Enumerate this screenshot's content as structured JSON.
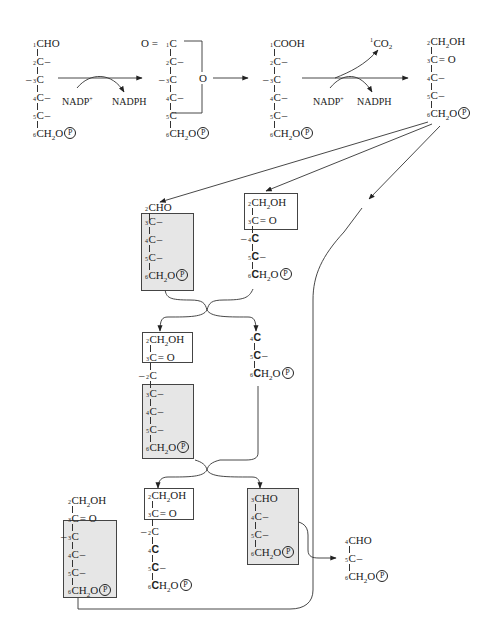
{
  "diagram": {
    "colors": {
      "line": "#333333",
      "box_border": "#444444",
      "highlight_box_fill": "#e6e6e6",
      "background": "#ffffff"
    },
    "phosphate_symbol": "P",
    "top_row": {
      "molecules": [
        {
          "id": "glucose-6-phosphate",
          "rows": [
            {
              "num": "1",
              "text": "CHO"
            },
            {
              "num": "2",
              "text": "C",
              "suffix": "–"
            },
            {
              "num": "3",
              "text": "C",
              "prefix": "–"
            },
            {
              "num": "4",
              "text": "C",
              "suffix": "–"
            },
            {
              "num": "5",
              "text": "C",
              "suffix": "–"
            },
            {
              "num": "6",
              "text": "CH",
              "sub": "2",
              "tail": "O",
              "phosphate": true
            }
          ]
        },
        {
          "id": "6-phosphoglucono-lactone",
          "rows": [
            {
              "num": "1",
              "text": "C",
              "prefix": "O = "
            },
            {
              "num": "2",
              "text": "C",
              "suffix": "–"
            },
            {
              "num": "3",
              "text": "C",
              "prefix": "–"
            },
            {
              "num": "4",
              "text": "C",
              "suffix": "–"
            },
            {
              "num": "5",
              "text": "C"
            },
            {
              "num": "6",
              "text": "CH",
              "sub": "2",
              "tail": "O",
              "phosphate": true
            }
          ],
          "ring_oxygen": "O"
        },
        {
          "id": "6-phosphogluconate",
          "rows": [
            {
              "num": "1",
              "text": "COOH"
            },
            {
              "num": "2",
              "text": "C",
              "suffix": "–"
            },
            {
              "num": "3",
              "text": "C",
              "prefix": "–"
            },
            {
              "num": "4",
              "text": "C",
              "suffix": "–"
            },
            {
              "num": "5",
              "text": "C",
              "suffix": "–"
            },
            {
              "num": "6",
              "text": "CH",
              "sub": "2",
              "tail": "O",
              "phosphate": true
            }
          ]
        },
        {
          "id": "ribulose-5-phosphate",
          "rows": [
            {
              "num": "2",
              "text": "CH",
              "sub": "2",
              "tail": "OH"
            },
            {
              "num": "3",
              "text": "C",
              "suffix": "= O"
            },
            {
              "num": "4",
              "text": "C",
              "suffix": "–"
            },
            {
              "num": "5",
              "text": "C",
              "suffix": "–"
            },
            {
              "num": "6",
              "text": "CH",
              "sub": "2",
              "tail": "O",
              "phosphate": true
            }
          ]
        }
      ],
      "reaction_1": {
        "cofactor_in": "NADP",
        "cofactor_in_sup": "+",
        "cofactor_out": "NADPH"
      },
      "reaction_3": {
        "cofactor_in": "NADP",
        "cofactor_in_sup": "+",
        "cofactor_out": "NADPH",
        "released": "CO",
        "released_sub": "2",
        "released_num": "1"
      }
    },
    "middle": {
      "aldose_C5": {
        "head": {
          "num": "2",
          "text": "CHO"
        },
        "rows": [
          {
            "num": "3",
            "text": "C",
            "suffix": "–"
          },
          {
            "num": "4",
            "text": "C",
            "suffix": "–"
          },
          {
            "num": "5",
            "text": "C",
            "suffix": "–"
          },
          {
            "num": "6",
            "text": "CH",
            "sub": "2",
            "tail": "O",
            "phosphate": true
          }
        ]
      },
      "ketose_C5": {
        "box_rows": [
          {
            "num": "2",
            "text": "CH",
            "sub": "2",
            "tail": "OH"
          },
          {
            "num": "3",
            "text": "C",
            "suffix": "= O"
          }
        ],
        "rows": [
          {
            "num": "4",
            "text": "C",
            "prefix": "–",
            "bold": true
          },
          {
            "num": "5",
            "text": "C",
            "suffix": "–",
            "bold": true
          },
          {
            "num": "6",
            "text": "C",
            "bold": true,
            "tail": "H",
            "sub": "2",
            "tail2": "O",
            "phosphate": true
          }
        ]
      },
      "ketose_C7": {
        "box_rows": [
          {
            "num": "2",
            "text": "CH",
            "sub": "2",
            "tail": "OH"
          },
          {
            "num": "3",
            "text": "C",
            "suffix": "= O"
          }
        ],
        "mid_row": {
          "num": "2",
          "text": "C",
          "prefix": "–"
        },
        "gray_rows": [
          {
            "num": "3",
            "text": "C",
            "suffix": "–"
          },
          {
            "num": "4",
            "text": "C",
            "suffix": "–"
          },
          {
            "num": "5",
            "text": "C",
            "suffix": "–"
          },
          {
            "num": "6",
            "text": "CH",
            "sub": "2",
            "tail": "O",
            "phosphate": true
          }
        ]
      },
      "triose_C3": {
        "rows": [
          {
            "num": "4",
            "text": "C",
            "bold": true
          },
          {
            "num": "5",
            "text": "C",
            "suffix": "–",
            "bold": true
          },
          {
            "num": "6",
            "text": "C",
            "bold": true,
            "tail": "H",
            "sub": "2",
            "tail2": "O",
            "phosphate": true
          }
        ]
      }
    },
    "bottom": {
      "ketose_C6_left": {
        "head_rows": [
          {
            "num": "2",
            "text": "CH",
            "sub": "2",
            "tail": "OH"
          },
          {
            "num": "3",
            "text": "C",
            "suffix": "= O"
          }
        ],
        "gray_rows": [
          {
            "num": "3",
            "text": "C",
            "prefix": "–"
          },
          {
            "num": "4",
            "text": "C",
            "suffix": "–"
          },
          {
            "num": "5",
            "text": "C",
            "suffix": "–"
          },
          {
            "num": "6",
            "text": "CH",
            "sub": "2",
            "tail": "O",
            "phosphate": true
          }
        ]
      },
      "ketose_C6_middle": {
        "box_rows": [
          {
            "num": "2",
            "text": "CH",
            "sub": "2",
            "tail": "OH"
          },
          {
            "num": "3",
            "text": "C",
            "suffix": "= O"
          }
        ],
        "rows": [
          {
            "num": "2",
            "text": "C",
            "prefix": "–"
          },
          {
            "num": "4",
            "text": "C",
            "bold": true
          },
          {
            "num": "5",
            "text": "C",
            "suffix": "–",
            "bold": true
          },
          {
            "num": "6",
            "text": "C",
            "bold": true,
            "tail": "H",
            "sub": "2",
            "tail2": "O",
            "phosphate": true
          }
        ]
      },
      "aldose_C4": {
        "gray_rows": [
          {
            "num": "3",
            "text": "CHO"
          },
          {
            "num": "4",
            "text": "C",
            "suffix": "–"
          },
          {
            "num": "5",
            "text": "C",
            "suffix": "–"
          },
          {
            "num": "6",
            "text": "CH",
            "sub": "2",
            "tail": "O",
            "phosphate": true
          }
        ]
      },
      "triose_product": {
        "rows": [
          {
            "num": "4",
            "text": "CHO"
          },
          {
            "num": "5",
            "text": "C",
            "suffix": "–"
          },
          {
            "num": "6",
            "text": "CH",
            "sub": "2",
            "tail": "O",
            "phosphate": true
          }
        ]
      }
    }
  }
}
